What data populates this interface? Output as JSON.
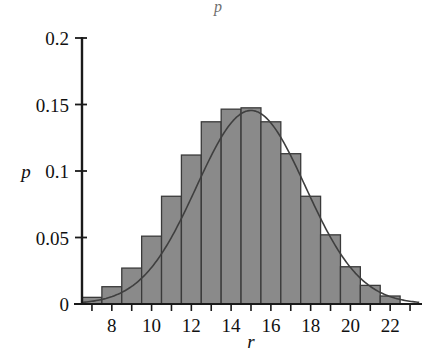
{
  "figure": {
    "background_color": "#ffffff",
    "top_partial_mark": "p"
  },
  "axes": {
    "x_label": "r",
    "y_label": "p",
    "x_ticks": [
      "8",
      "10",
      "12",
      "14",
      "16",
      "18",
      "20",
      "22"
    ],
    "y_ticks": [
      "0.2",
      "0.15",
      "0.1",
      "0.05",
      "0"
    ],
    "x_tick_values": [
      8,
      10,
      12,
      14,
      16,
      18,
      20,
      22
    ],
    "y_tick_values": [
      0.2,
      0.15,
      0.1,
      0.05,
      0
    ],
    "axis_color": "#1a1a1a",
    "grid_color": "#b9b9c6",
    "minor_tick_values": [
      7,
      8,
      9,
      10,
      11,
      12,
      13,
      14,
      15,
      16,
      17,
      18,
      19,
      20,
      21,
      22,
      23
    ]
  },
  "style": {
    "bar_fill": "#8a8a8a",
    "bar_stroke": "#3a3a3a",
    "curve_color": "#3f3f3f",
    "grid_on": true,
    "legend": "none"
  },
  "chart_data": {
    "type": "bar",
    "title": "",
    "subtitle": "",
    "xlabel": "r",
    "ylabel": "p",
    "xlim": [
      6.5,
      23.5
    ],
    "ylim": [
      0,
      0.2
    ],
    "grid": true,
    "legend_position": "none",
    "bar_width": 1,
    "categories": [
      7,
      8,
      9,
      10,
      11,
      12,
      13,
      14,
      15,
      16,
      17,
      18,
      19,
      20,
      21,
      22
    ],
    "values": [
      0.005,
      0.013,
      0.027,
      0.051,
      0.081,
      0.112,
      0.137,
      0.1465,
      0.1475,
      0.137,
      0.113,
      0.081,
      0.052,
      0.028,
      0.014,
      0.006
    ],
    "series": [
      {
        "name": "Binomial probability",
        "type": "bar",
        "values": [
          0.005,
          0.013,
          0.027,
          0.051,
          0.081,
          0.112,
          0.137,
          0.1465,
          0.1475,
          0.137,
          0.113,
          0.081,
          0.052,
          0.028,
          0.014,
          0.006
        ]
      },
      {
        "name": "Gaussian approximation",
        "type": "line",
        "mean": 15,
        "sigma": 2.74,
        "peak": 0.1455,
        "x": [
          6.5,
          7,
          7.5,
          8,
          8.5,
          9,
          9.5,
          10,
          10.5,
          11,
          11.5,
          12,
          12.5,
          13,
          13.5,
          14,
          14.5,
          15,
          15.5,
          16,
          16.5,
          17,
          17.5,
          18,
          18.5,
          19,
          19.5,
          20,
          20.5,
          21,
          21.5,
          22,
          22.5,
          23
        ],
        "values": [
          0.0035,
          0.0055,
          0.0085,
          0.0127,
          0.0182,
          0.0252,
          0.0336,
          0.0432,
          0.0535,
          0.0639,
          0.0736,
          0.0819,
          0.0879,
          0.0911,
          0.0911,
          0.0879,
          0.0819,
          0.0736,
          0.0639,
          0.0535,
          0.0432,
          0.0336,
          0.0252,
          0.0182,
          0.0127,
          0.0085,
          0.0055,
          0.0035,
          0.0021,
          0.0012,
          0.0007,
          0.0004,
          0.0002,
          0.0001
        ]
      }
    ]
  }
}
